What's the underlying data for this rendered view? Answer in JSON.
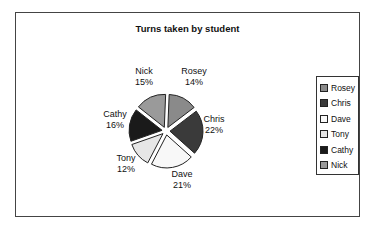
{
  "chart_data": {
    "type": "pie",
    "title": "Turns taken by student",
    "exploded": true,
    "categories": [
      "Rosey",
      "Chris",
      "Dave",
      "Tony",
      "Cathy",
      "Nick"
    ],
    "values": [
      14,
      22,
      21,
      12,
      16,
      15
    ],
    "labels": [
      "14%",
      "22%",
      "21%",
      "12%",
      "16%",
      "15%"
    ],
    "colors": [
      "#8a8a8a",
      "#3a3a3a",
      "#f8f8f8",
      "#e6e6e6",
      "#1a1a1a",
      "#9a9a9a"
    ],
    "legend_position": "right"
  },
  "legend": {
    "items": [
      {
        "label": "Rosey",
        "color": "#8a8a8a"
      },
      {
        "label": "Chris",
        "color": "#3a3a3a"
      },
      {
        "label": "Dave",
        "color": "#f8f8f8"
      },
      {
        "label": "Tony",
        "color": "#e6e6e6"
      },
      {
        "label": "Cathy",
        "color": "#1a1a1a"
      },
      {
        "label": "Nick",
        "color": "#9a9a9a"
      }
    ]
  },
  "data_labels": {
    "rosey": {
      "name": "Rosey",
      "pct": "14%"
    },
    "chris": {
      "name": "Chris",
      "pct": "22%"
    },
    "dave": {
      "name": "Dave",
      "pct": "21%"
    },
    "tony": {
      "name": "Tony",
      "pct": "12%"
    },
    "cathy": {
      "name": "Cathy",
      "pct": "16%"
    },
    "nick": {
      "name": "Nick",
      "pct": "15%"
    }
  }
}
